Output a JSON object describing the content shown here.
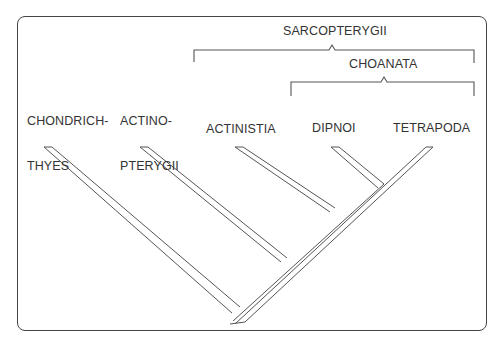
{
  "diagram": {
    "type": "cladogram",
    "taxa": [
      {
        "id": "chondrichthyes",
        "label_line1": "CHONDRICH-",
        "label_line2": "THYES"
      },
      {
        "id": "actinopterygii",
        "label_line1": "ACTINO-",
        "label_line2": "PTERYGII"
      },
      {
        "id": "actinistia",
        "label_line1": "ACTINISTIA",
        "label_line2": ""
      },
      {
        "id": "dipnoi",
        "label_line1": "DIPNOI",
        "label_line2": ""
      },
      {
        "id": "tetrapoda",
        "label_line1": "TETRAPODA",
        "label_line2": ""
      }
    ],
    "clades": [
      {
        "id": "sarcopterygii",
        "label": "SARCOPTERYGII",
        "members": [
          "actinistia",
          "dipnoi",
          "tetrapoda"
        ]
      },
      {
        "id": "choanata",
        "label": "CHOANATA",
        "members": [
          "dipnoi",
          "tetrapoda"
        ]
      }
    ],
    "line_color": "#555555"
  }
}
